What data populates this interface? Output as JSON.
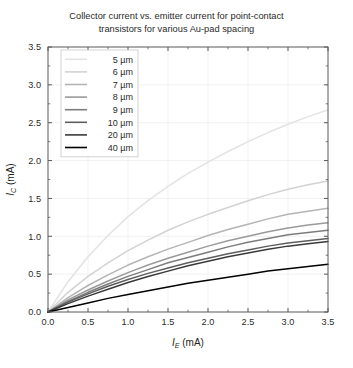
{
  "chart_data": {
    "type": "line",
    "title": "Collector current vs. emitter current for point-contact transistors for various Au-pad spacing",
    "title_line1": "Collector current vs. emitter current for point-contact",
    "title_line2": "transistors for various Au-pad spacing",
    "xlabel": "I_E (mA)",
    "xlabel_sym": "I",
    "xlabel_sub": "E",
    "xlabel_unit": " (mA)",
    "ylabel": "I_C (mA)",
    "ylabel_sym": "I",
    "ylabel_sub": "C",
    "ylabel_unit": " (mA)",
    "xlim": [
      0,
      3.5
    ],
    "ylim": [
      0,
      3.5
    ],
    "xticks": [
      "0.0",
      "0.5",
      "1.0",
      "1.5",
      "2.0",
      "2.5",
      "3.0",
      "3.5"
    ],
    "yticks": [
      "0.0",
      "0.5",
      "1.0",
      "1.5",
      "2.0",
      "2.5",
      "3.0",
      "3.5"
    ],
    "xtick_values": [
      0,
      0.5,
      1.0,
      1.5,
      2.0,
      2.5,
      3.0,
      3.5
    ],
    "ytick_values": [
      0,
      0.5,
      1.0,
      1.5,
      2.0,
      2.5,
      3.0,
      3.5
    ],
    "grid": true,
    "minor_ticks": true,
    "legend_position": "upper left",
    "x": [
      0,
      0.25,
      0.5,
      0.75,
      1.0,
      1.25,
      1.5,
      1.75,
      2.0,
      2.25,
      2.5,
      2.75,
      3.0,
      3.25,
      3.5
    ],
    "series": [
      {
        "name": "5 µm",
        "label": "5 µm",
        "spacing_um": 5,
        "color": "#e3e3e3",
        "values": [
          0,
          0.4,
          0.73,
          1.01,
          1.26,
          1.47,
          1.66,
          1.83,
          1.98,
          2.12,
          2.25,
          2.37,
          2.48,
          2.58,
          2.67
        ]
      },
      {
        "name": "6 µm",
        "label": "6 µm",
        "spacing_um": 6,
        "color": "#d2d2d2",
        "values": [
          0,
          0.26,
          0.47,
          0.65,
          0.81,
          0.95,
          1.08,
          1.19,
          1.29,
          1.38,
          1.47,
          1.55,
          1.62,
          1.68,
          1.73
        ]
      },
      {
        "name": "7 µm",
        "label": "7 µm",
        "spacing_um": 7,
        "color": "#b4b4b4",
        "values": [
          0,
          0.19,
          0.35,
          0.49,
          0.62,
          0.73,
          0.83,
          0.92,
          1.01,
          1.09,
          1.16,
          1.23,
          1.29,
          1.33,
          1.37
        ]
      },
      {
        "name": "8 µm",
        "label": "8 µm",
        "spacing_um": 8,
        "color": "#9a9a9a",
        "values": [
          0,
          0.16,
          0.29,
          0.41,
          0.52,
          0.62,
          0.71,
          0.79,
          0.87,
          0.94,
          1.0,
          1.06,
          1.11,
          1.15,
          1.18
        ]
      },
      {
        "name": "9 µm",
        "label": "9 µm",
        "spacing_um": 9,
        "color": "#7d7d7d",
        "values": [
          0,
          0.14,
          0.26,
          0.37,
          0.47,
          0.56,
          0.65,
          0.72,
          0.79,
          0.86,
          0.92,
          0.97,
          1.02,
          1.05,
          1.08
        ]
      },
      {
        "name": "10 µm",
        "label": "10 µm",
        "spacing_um": 10,
        "color": "#5e5e5e",
        "values": [
          0,
          0.13,
          0.24,
          0.34,
          0.43,
          0.51,
          0.58,
          0.65,
          0.71,
          0.77,
          0.82,
          0.87,
          0.91,
          0.94,
          0.97
        ]
      },
      {
        "name": "20 µm",
        "label": "20 µm",
        "spacing_um": 20,
        "color": "#3a3a3a",
        "values": [
          0,
          0.11,
          0.21,
          0.3,
          0.39,
          0.47,
          0.54,
          0.61,
          0.67,
          0.73,
          0.78,
          0.83,
          0.87,
          0.9,
          0.93
        ]
      },
      {
        "name": "40 µm",
        "label": "40 µm",
        "spacing_um": 40,
        "color": "#000000",
        "values": [
          0,
          0.06,
          0.12,
          0.18,
          0.23,
          0.28,
          0.33,
          0.38,
          0.42,
          0.46,
          0.5,
          0.54,
          0.57,
          0.6,
          0.63
        ]
      }
    ]
  }
}
